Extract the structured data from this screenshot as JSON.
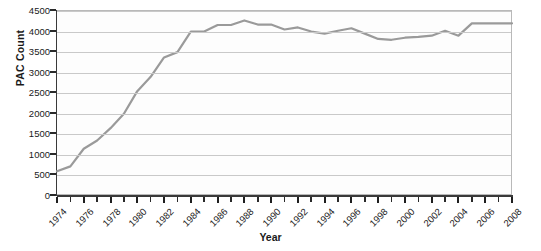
{
  "chart_data": {
    "type": "line",
    "title": "",
    "xlabel": "Year",
    "ylabel": "PAC Count",
    "xlim": [
      1974,
      2008
    ],
    "ylim": [
      0,
      4500
    ],
    "ytick_step": 500,
    "yticks": [
      0,
      500,
      1000,
      1500,
      2000,
      2500,
      3000,
      3500,
      4000,
      4500
    ],
    "xticks_major": [
      1974,
      1976,
      1978,
      1980,
      1982,
      1984,
      1986,
      1988,
      1990,
      1992,
      1994,
      1996,
      1998,
      2000,
      2002,
      2004,
      2006,
      2008
    ],
    "xticks_all": [
      1974,
      1975,
      1976,
      1977,
      1978,
      1979,
      1980,
      1981,
      1982,
      1983,
      1984,
      1985,
      1986,
      1987,
      1988,
      1989,
      1990,
      1991,
      1992,
      1993,
      1994,
      1995,
      1996,
      1997,
      1998,
      1999,
      2000,
      2001,
      2002,
      2003,
      2004,
      2005,
      2006,
      2007,
      2008
    ],
    "grid": "horizontal",
    "legend": "none",
    "line_color": "#9a9a9a",
    "line_width": 2.2,
    "markers": "none",
    "x": [
      1974,
      1975,
      1976,
      1977,
      1978,
      1979,
      1980,
      1981,
      1982,
      1983,
      1984,
      1985,
      1986,
      1987,
      1988,
      1989,
      1990,
      1991,
      1992,
      1993,
      1994,
      1995,
      1996,
      1997,
      1998,
      1999,
      2000,
      2001,
      2002,
      2003,
      2004,
      2005,
      2006,
      2007,
      2008
    ],
    "values": [
      600,
      720,
      1150,
      1350,
      1650,
      2000,
      2550,
      2900,
      3370,
      3500,
      4000,
      4000,
      4160,
      4160,
      4270,
      4170,
      4170,
      4050,
      4100,
      4000,
      3950,
      4020,
      4080,
      3950,
      3820,
      3800,
      3850,
      3870,
      3900,
      4020,
      3900,
      4200,
      4200,
      4200,
      4200
    ],
    "series_name": "PAC Count"
  },
  "labels": {
    "y_axis_title": "PAC Count",
    "x_axis_title": "Year"
  }
}
